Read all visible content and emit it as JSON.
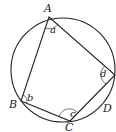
{
  "diagram": {
    "stroke_color": "#222222",
    "circle": {
      "cx": 63,
      "cy": 70,
      "r": 52
    },
    "vertices": [
      {
        "name": "A",
        "x": 49,
        "y": 17,
        "label": "A",
        "label_x": 44,
        "label_y": 12
      },
      {
        "name": "B",
        "x": 21,
        "y": 101,
        "label": "B",
        "label_x": 10,
        "label_y": 109
      },
      {
        "name": "C",
        "x": 70,
        "y": 121,
        "label": "C",
        "label_x": 65,
        "label_y": 131
      },
      {
        "name": "D",
        "x": 115,
        "y": 75,
        "label": "D",
        "label_x": 103,
        "label_y": 112
      }
    ],
    "angles": [
      {
        "at": "A",
        "label": "a",
        "label_x": 50,
        "label_y": 34
      },
      {
        "at": "B",
        "label": "b",
        "label_x": 27,
        "label_y": 101
      },
      {
        "at": "C",
        "label": "c",
        "label_x": 71,
        "label_y": 116
      },
      {
        "at": "D",
        "label": "d",
        "label_x": 100,
        "label_y": 78
      }
    ]
  }
}
